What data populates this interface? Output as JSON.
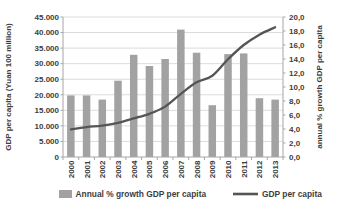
{
  "chart_data": {
    "type": "bar",
    "subtype": "combo-bar-line-dual-axis",
    "categories": [
      "2000",
      "2001",
      "2002",
      "2003",
      "2004",
      "2005",
      "2006",
      "2007",
      "2008",
      "2009",
      "2010",
      "2011",
      "2012",
      "2013"
    ],
    "series": [
      {
        "name": "Annual % growth GDP per capita",
        "chart_type": "bar",
        "axis": "right",
        "color": "#a2a2a2",
        "values": [
          8.8,
          8.8,
          8.2,
          10.9,
          14.6,
          13.0,
          14.0,
          18.2,
          14.9,
          7.4,
          14.7,
          14.8,
          8.4,
          8.2
        ]
      },
      {
        "name": "GDP per capita",
        "chart_type": "line",
        "axis": "left",
        "color": "#555555",
        "values": [
          8900,
          9600,
          10100,
          11000,
          12400,
          13900,
          16200,
          20300,
          24000,
          26100,
          31400,
          36000,
          39300,
          41700
        ]
      }
    ],
    "left_axis": {
      "title": "GDP per capita (Yuan 100 million)",
      "min": 0,
      "max": 45000,
      "step": 5000,
      "tick_labels": [
        "0",
        "5.000",
        "10.000",
        "15.000",
        "20.000",
        "25.000",
        "30.000",
        "35.000",
        "40.000",
        "45.000"
      ]
    },
    "right_axis": {
      "title": "annual % growth GDP per capita",
      "min": 0,
      "max": 20,
      "step": 2,
      "tick_labels": [
        "0,0",
        "2,0",
        "4,0",
        "6,0",
        "8,0",
        "10,0",
        "12,0",
        "14,0",
        "16,0",
        "18,0",
        "20,0"
      ]
    },
    "x_axis": {
      "tick_labels": [
        "2000",
        "2001",
        "2002",
        "2003",
        "2004",
        "2005",
        "2006",
        "2007",
        "2008",
        "2009",
        "2010",
        "2011",
        "2012",
        "2013"
      ]
    },
    "legend": {
      "position": "bottom",
      "entries": [
        {
          "label": "Annual % growth GDP per capita",
          "swatch": "bar"
        },
        {
          "label": "GDP per capita",
          "swatch": "line"
        }
      ]
    },
    "grid": true,
    "colors": {
      "grid": "#dcdcdc",
      "axis": "#a6a6a6",
      "text": "#3d3d3d",
      "background": "#ffffff"
    }
  }
}
